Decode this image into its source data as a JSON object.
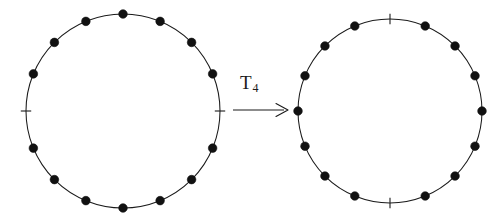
{
  "figure": {
    "background_color": "#ffffff",
    "stroke_color": "#1a1a1a",
    "dot_color": "#111111",
    "arrow": {
      "label_main": "T",
      "label_sub": "4",
      "label_full": "T4",
      "direction": "right",
      "icon": "right-arrow-icon"
    },
    "circles": [
      {
        "id": "left",
        "name": "source-circle",
        "center_x": 123,
        "center_y": 111,
        "radius": 97,
        "positions": 16,
        "start_angle_deg": -90,
        "markers": [
          {
            "index": 0,
            "type": "dot"
          },
          {
            "index": 1,
            "type": "dot"
          },
          {
            "index": 2,
            "type": "dot"
          },
          {
            "index": 3,
            "type": "dot"
          },
          {
            "index": 4,
            "type": "tick"
          },
          {
            "index": 5,
            "type": "dot"
          },
          {
            "index": 6,
            "type": "dot"
          },
          {
            "index": 7,
            "type": "dot"
          },
          {
            "index": 8,
            "type": "dot"
          },
          {
            "index": 9,
            "type": "dot"
          },
          {
            "index": 10,
            "type": "dot"
          },
          {
            "index": 11,
            "type": "dot"
          },
          {
            "index": 12,
            "type": "tick"
          },
          {
            "index": 13,
            "type": "dot"
          },
          {
            "index": 14,
            "type": "dot"
          },
          {
            "index": 15,
            "type": "dot"
          }
        ]
      },
      {
        "id": "right",
        "name": "result-circle",
        "center_x": 130,
        "center_y": 111,
        "radius": 92,
        "positions": 16,
        "start_angle_deg": -90,
        "markers": [
          {
            "index": 0,
            "type": "tick"
          },
          {
            "index": 1,
            "type": "dot"
          },
          {
            "index": 2,
            "type": "dot"
          },
          {
            "index": 3,
            "type": "dot"
          },
          {
            "index": 4,
            "type": "dot"
          },
          {
            "index": 5,
            "type": "dot"
          },
          {
            "index": 6,
            "type": "dot"
          },
          {
            "index": 7,
            "type": "dot"
          },
          {
            "index": 8,
            "type": "tick"
          },
          {
            "index": 9,
            "type": "dot"
          },
          {
            "index": 10,
            "type": "dot"
          },
          {
            "index": 11,
            "type": "dot"
          },
          {
            "index": 12,
            "type": "dot"
          },
          {
            "index": 13,
            "type": "dot"
          },
          {
            "index": 14,
            "type": "dot"
          },
          {
            "index": 15,
            "type": "dot"
          }
        ]
      }
    ]
  }
}
